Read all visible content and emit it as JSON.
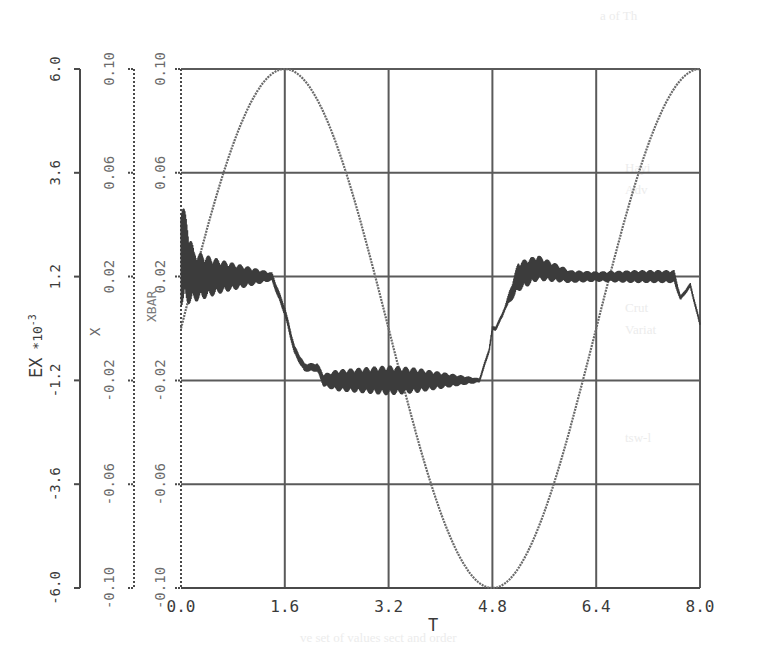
{
  "chart_data": {
    "type": "line",
    "title": "",
    "xlabel": "T",
    "xlim": [
      0.0,
      8.0
    ],
    "x_ticks": [
      "0.0",
      "1.6",
      "3.2",
      "4.8",
      "6.4",
      "8.0"
    ],
    "grid": true,
    "legend": null,
    "y_axes": [
      {
        "label": "EX *10^-3",
        "label_main": "EX",
        "label_sup": "-3",
        "label_mid": " *10",
        "ticks": [
          "6.0",
          "3.6",
          "1.2",
          "-1.2",
          "-3.6",
          "-6.0"
        ],
        "ylim": [
          -6.0,
          6.0
        ]
      },
      {
        "label": "X",
        "ticks": [
          "0.10",
          "0.06",
          "0.02",
          "-0.02",
          "-0.06",
          "-0.10"
        ],
        "ylim": [
          -0.1,
          0.1
        ]
      },
      {
        "label": "XBAR",
        "ticks": [
          "0.10",
          "0.06",
          "0.02",
          "-0.02",
          "-0.06",
          "-0.10"
        ],
        "ylim": [
          -0.1,
          0.1
        ]
      }
    ],
    "series": [
      {
        "name": "X / XBAR (reference sinusoid)",
        "axis": "X",
        "style": "dotted",
        "x": [
          0.0,
          0.4,
          0.8,
          1.2,
          1.6,
          2.0,
          2.4,
          2.8,
          3.2,
          3.6,
          4.0,
          4.4,
          4.8,
          5.2,
          5.6,
          6.0,
          6.4,
          6.8,
          7.2,
          7.6,
          8.0
        ],
        "values": [
          0.0,
          0.038,
          0.071,
          0.092,
          0.1,
          0.092,
          0.071,
          0.038,
          0.0,
          -0.038,
          -0.071,
          -0.092,
          -0.1,
          -0.092,
          -0.071,
          -0.038,
          0.0,
          0.038,
          0.071,
          0.092,
          0.1
        ]
      },
      {
        "name": "EX (tracking error)",
        "axis": "EX",
        "style": "oscillatory",
        "x": [
          0.0,
          0.2,
          0.6,
          1.0,
          1.4,
          1.6,
          1.75,
          1.9,
          2.1,
          2.2,
          2.4,
          2.8,
          3.2,
          3.6,
          4.0,
          4.4,
          4.6,
          4.75,
          4.8,
          4.85,
          4.95,
          5.0,
          5.2,
          5.5,
          6.0,
          6.4,
          7.0,
          7.6,
          7.7,
          7.85,
          8.0
        ],
        "values": [
          1.8,
          1.2,
          1.2,
          1.2,
          1.2,
          0.4,
          -0.5,
          -0.9,
          -0.9,
          -1.2,
          -1.2,
          -1.2,
          -1.2,
          -1.2,
          -1.2,
          -1.2,
          -1.2,
          -0.5,
          0.0,
          0.0,
          0.3,
          0.5,
          1.2,
          1.4,
          1.2,
          1.2,
          1.2,
          1.2,
          0.7,
          1.0,
          0.1
        ],
        "oscillation_amplitude": [
          1.3,
          0.6,
          0.4,
          0.25,
          0.1,
          0.1,
          0.1,
          0.1,
          0.1,
          0.15,
          0.25,
          0.3,
          0.35,
          0.3,
          0.2,
          0.1,
          0.05,
          0.05,
          0.05,
          0.05,
          0.05,
          0.05,
          0.35,
          0.3,
          0.15,
          0.12,
          0.15,
          0.15,
          0.05,
          0.05,
          0.05
        ]
      }
    ]
  },
  "axes_labels": {
    "x": "T",
    "ex": "EX",
    "ex_mult": "*10",
    "ex_exp": "-3",
    "x_axis": "X",
    "xbar": "XBAR"
  }
}
